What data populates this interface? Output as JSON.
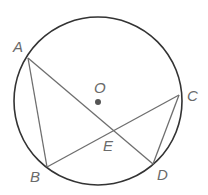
{
  "diagram": {
    "colors": {
      "circle": "#333333",
      "chord": "#6e6e6e",
      "center": "#555555",
      "label": "#6a6a6a"
    },
    "circle": {
      "cx": 98,
      "cy": 101,
      "r": 84
    },
    "center_point": {
      "label": "O",
      "x": 98,
      "y": 102,
      "label_x": 94,
      "label_y": 93
    },
    "points": [
      {
        "label": "A",
        "x": 28,
        "y": 58,
        "label_x": 13,
        "label_y": 52
      },
      {
        "label": "B",
        "x": 47,
        "y": 167,
        "label_x": 30,
        "label_y": 182
      },
      {
        "label": "C",
        "x": 179,
        "y": 95,
        "label_x": 187,
        "label_y": 101
      },
      {
        "label": "D",
        "x": 153,
        "y": 164,
        "label_x": 157,
        "label_y": 180
      },
      {
        "label": "E",
        "x": 112,
        "y": 130,
        "label_x": 103,
        "label_y": 151
      }
    ],
    "segments": [
      {
        "name": "AB",
        "from": "A",
        "to": "B"
      },
      {
        "name": "AD",
        "from": "A",
        "to": "D"
      },
      {
        "name": "BC",
        "from": "B",
        "to": "C"
      },
      {
        "name": "CD",
        "from": "C",
        "to": "D"
      }
    ]
  }
}
